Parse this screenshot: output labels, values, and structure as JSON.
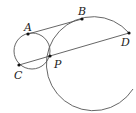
{
  "diagram": {
    "type": "geometry",
    "colors": {
      "stroke": "#555555",
      "point": "#111111",
      "label": "#222222"
    },
    "points": [
      {
        "id": "A",
        "label": "A",
        "x": 28,
        "y": 34
      },
      {
        "id": "B",
        "label": "B",
        "x": 82,
        "y": 19
      },
      {
        "id": "C",
        "label": "C",
        "x": 19,
        "y": 65
      },
      {
        "id": "D",
        "label": "D",
        "x": 129,
        "y": 33
      },
      {
        "id": "P",
        "label": "P",
        "x": 50,
        "y": 56
      }
    ],
    "segments": [
      {
        "from": "A",
        "to": "B"
      },
      {
        "from": "C",
        "to": "D"
      }
    ],
    "circles": [
      {
        "id": "small",
        "cx": 32,
        "cy": 51,
        "r": 18
      },
      {
        "id": "large",
        "cx": 97,
        "cy": 63,
        "r": 47
      }
    ]
  }
}
